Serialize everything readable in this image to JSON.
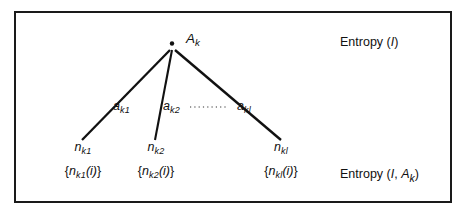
{
  "figure": {
    "type": "tree-diagram",
    "frame": {
      "border_color": "#1a1a1a",
      "background": "#ffffff"
    },
    "root": {
      "node_marker": "dot-node",
      "label_base": "A",
      "label_sub": "k",
      "x": 172,
      "y": 44
    },
    "edges": [
      {
        "name": "edge-1",
        "label_base": "a",
        "label_sub": "k1",
        "from_x": 172,
        "from_y": 50,
        "to_x": 82,
        "to_y": 140
      },
      {
        "name": "edge-2",
        "label_base": "a",
        "label_sub": "k2",
        "from_x": 172,
        "from_y": 50,
        "to_x": 155,
        "to_y": 140
      },
      {
        "name": "edge-3",
        "label_base": "a",
        "label_sub": "kl",
        "from_x": 172,
        "from_y": 50,
        "to_x": 281,
        "to_y": 140
      }
    ],
    "ellipsis": {
      "name": "edge-ellipsis",
      "style": "dotted",
      "x1": 190,
      "x2": 228,
      "y": 107
    },
    "leaves": [
      {
        "name": "leaf-1",
        "x": 83,
        "node_base": "n",
        "node_sub": "k1",
        "set_open": "{",
        "set_base": "n",
        "set_sub": "k1",
        "set_arg": "(i)",
        "set_close": "}"
      },
      {
        "name": "leaf-2",
        "x": 156,
        "node_base": "n",
        "node_sub": "k2",
        "set_open": "{",
        "set_base": "n",
        "set_sub": "k2",
        "set_arg": "(i)",
        "set_close": "}"
      },
      {
        "name": "leaf-3",
        "x": 281,
        "node_base": "n",
        "node_sub": "kl",
        "set_open": "{",
        "set_base": "n",
        "set_sub": "kl",
        "set_arg": "(i)",
        "set_close": "}"
      }
    ],
    "annotations": {
      "top_right": {
        "name": "entropy-top-label",
        "word": "Entropy",
        "open": "(",
        "arg1": "I",
        "close": ")",
        "x": 340,
        "y": 36
      },
      "bottom_right": {
        "name": "entropy-bottom-label",
        "word": "Entropy",
        "open": "(",
        "arg1": "I",
        "comma": ",",
        "arg2_base": "A",
        "arg2_sub": "k",
        "close": ")",
        "x": 340,
        "y": 168
      }
    }
  }
}
